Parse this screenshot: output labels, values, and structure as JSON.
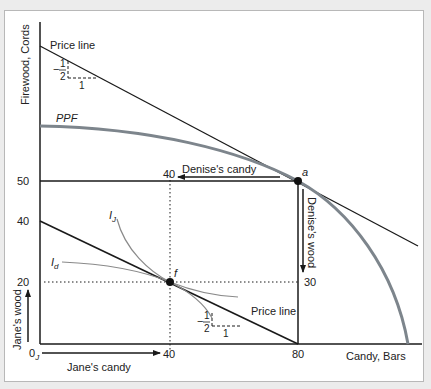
{
  "diagram": {
    "y_axis_label": "Firewood, Cords",
    "x_axis_label": "Candy, Bars",
    "price_line_top_label": "Price line",
    "price_line_bottom_label": "Price line",
    "ppf_label": "PPF",
    "slope_top": {
      "minus": "−",
      "num": "1",
      "den": "2",
      "run": "1"
    },
    "slope_bottom": {
      "minus": "−",
      "num": "1",
      "den": "2",
      "run": "1"
    },
    "denise_candy_label": "Denise's candy",
    "denise_wood_label": "Denise's wood",
    "jane_wood_label": "Jane's wood",
    "jane_candy_label": "Jane's candy",
    "origin_label": "0",
    "origin_sub": "J",
    "point_a_label": "a",
    "point_f_label": "f",
    "ij_label": "I",
    "ij_sub": "J",
    "id_label": "I",
    "id_sub": "d",
    "ticks": {
      "y_50": "50",
      "y_40": "40",
      "y_20": "20",
      "x_40_top": "40",
      "x_40_bottom": "40",
      "x_80": "80",
      "denise_wood_30": "30"
    },
    "colors": {
      "line": "#1a1a1a",
      "ppf": "#7d858c",
      "indifference": "#8a8a8a",
      "frame_border": "#b8b8b8",
      "background": "#ffffff"
    }
  }
}
